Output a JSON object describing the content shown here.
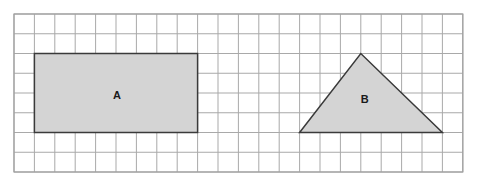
{
  "grid": {
    "origin_x": 14,
    "origin_y": 14,
    "columns": 22,
    "rows": 8,
    "cell_width": 20.4,
    "cell_height": 19.75,
    "line_color": "#a9a9a9"
  },
  "shapes": [
    {
      "id": "A",
      "type": "rectangle",
      "label": "A",
      "vertices_grid": [
        [
          1,
          2
        ],
        [
          9,
          2
        ],
        [
          9,
          6
        ],
        [
          1,
          6
        ]
      ],
      "width_units": 8,
      "height_units": 4,
      "fill": "#d4d4d4",
      "stroke": "#3a3a3a"
    },
    {
      "id": "B",
      "type": "triangle",
      "label": "B",
      "vertices_grid": [
        [
          14,
          6
        ],
        [
          17,
          2
        ],
        [
          21,
          6
        ]
      ],
      "base_units": 7,
      "height_units": 4,
      "fill": "#d4d4d4",
      "stroke": "#3a3a3a"
    }
  ],
  "labels": {
    "shape_a": "A",
    "shape_b": "B"
  }
}
